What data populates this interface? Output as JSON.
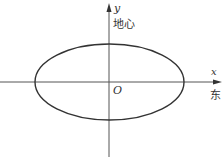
{
  "diagram": {
    "axes": {
      "x_label": "x",
      "y_label": "y",
      "origin_label": "O",
      "x_direction_label": "东",
      "y_direction_label": "地心"
    },
    "shape": "ellipse",
    "colors": {
      "stroke": "#333333",
      "background": "#ffffff"
    }
  }
}
